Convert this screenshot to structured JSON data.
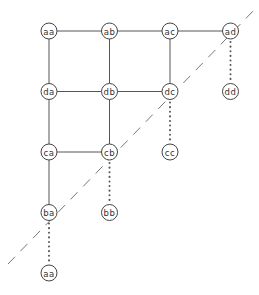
{
  "diagram": {
    "type": "lattice-graph",
    "nodes": [
      {
        "id": "n-aa-top",
        "label": "aa",
        "col": 0,
        "row": 0
      },
      {
        "id": "n-ab",
        "label": "ab",
        "col": 1,
        "row": 0
      },
      {
        "id": "n-ac",
        "label": "ac",
        "col": 2,
        "row": 0
      },
      {
        "id": "n-ad",
        "label": "ad",
        "col": 3,
        "row": 0
      },
      {
        "id": "n-da",
        "label": "da",
        "col": 0,
        "row": 1
      },
      {
        "id": "n-db",
        "label": "db",
        "col": 1,
        "row": 1
      },
      {
        "id": "n-dc",
        "label": "dc",
        "col": 2,
        "row": 1
      },
      {
        "id": "n-dd",
        "label": "dd",
        "col": 3,
        "row": 1
      },
      {
        "id": "n-ca",
        "label": "ca",
        "col": 0,
        "row": 2
      },
      {
        "id": "n-cb",
        "label": "cb",
        "col": 1,
        "row": 2
      },
      {
        "id": "n-cc",
        "label": "cc",
        "col": 2,
        "row": 2
      },
      {
        "id": "n-ba",
        "label": "ba",
        "col": 0,
        "row": 3
      },
      {
        "id": "n-bb",
        "label": "bb",
        "col": 1,
        "row": 3
      },
      {
        "id": "n-aa-bottom",
        "label": "aa",
        "col": 0,
        "row": 4
      }
    ],
    "solid_edges": [
      [
        "n-aa-top",
        "n-ab"
      ],
      [
        "n-ab",
        "n-ac"
      ],
      [
        "n-ac",
        "n-ad"
      ],
      [
        "n-da",
        "n-db"
      ],
      [
        "n-db",
        "n-dc"
      ],
      [
        "n-ca",
        "n-cb"
      ],
      [
        "n-aa-top",
        "n-da"
      ],
      [
        "n-da",
        "n-ca"
      ],
      [
        "n-ca",
        "n-ba"
      ],
      [
        "n-ab",
        "n-db"
      ],
      [
        "n-db",
        "n-cb"
      ],
      [
        "n-ac",
        "n-dc"
      ]
    ],
    "dotted_edges": [
      [
        "n-ad",
        "n-dd"
      ],
      [
        "n-dc",
        "n-cc"
      ],
      [
        "n-cb",
        "n-bb"
      ],
      [
        "n-ba",
        "n-aa-bottom"
      ]
    ],
    "diagonal": {
      "style": "dashed",
      "direction": "lower-left to upper-right"
    }
  }
}
